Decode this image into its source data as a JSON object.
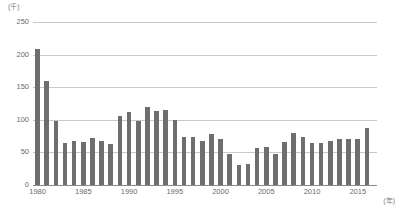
{
  "chart_data": {
    "type": "bar",
    "title": "",
    "subtitle": "",
    "xlabel": "(年)",
    "ylabel": "(千)",
    "unit_y_caption": "(千)",
    "unit_x_caption": "(年)",
    "grid": true,
    "legend": null,
    "ylim": [
      0,
      250
    ],
    "ytick_values": [
      0,
      50,
      100,
      150,
      200,
      250
    ],
    "ytick_labels": [
      "0",
      "50",
      "100",
      "150",
      "200",
      "250"
    ],
    "xtick_labels": [
      "1980",
      "1985",
      "1990",
      "1995",
      "2000",
      "2005",
      "2010",
      "2015"
    ],
    "xtick_years": [
      1980,
      1985,
      1990,
      1995,
      2000,
      2005,
      2010,
      2015
    ],
    "bar_color": "#6e6e6e",
    "gridline_color": "#c9c9c9",
    "axis_color": "#8a8a8a",
    "categories": [
      "1980",
      "1981",
      "1982",
      "1983",
      "1984",
      "1985",
      "1986",
      "1987",
      "1988",
      "1989",
      "1990",
      "1991",
      "1992",
      "1993",
      "1994",
      "1995",
      "1996",
      "1997",
      "1998",
      "1999",
      "2000",
      "2001",
      "2002",
      "2003",
      "2004",
      "2005",
      "2006",
      "2007",
      "2008",
      "2009",
      "2010",
      "2011",
      "2012",
      "2013",
      "2014",
      "2015",
      "2016"
    ],
    "values": [
      208,
      160,
      98,
      65,
      68,
      66,
      72,
      68,
      63,
      106,
      112,
      98,
      119,
      113,
      115,
      99,
      73,
      74,
      68,
      78,
      70,
      47,
      30,
      32,
      57,
      59,
      48,
      66,
      80,
      74,
      64,
      65,
      68,
      70,
      71,
      71,
      88
    ]
  }
}
